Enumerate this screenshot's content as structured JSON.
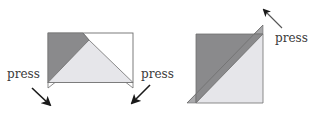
{
  "figures": [
    {
      "id": "left",
      "description": "Rectangle with dark top-left triangle, light center triangle, bottom flaps pressed down",
      "press_labels": [
        {
          "text": "press",
          "side": "left"
        },
        {
          "text": "press",
          "side": "right"
        }
      ]
    },
    {
      "id": "right",
      "description": "Square split diagonally into dark upper-left and light lower-right triangles with corner flaps",
      "press_labels": [
        {
          "text": "press",
          "side": "top-right"
        }
      ]
    }
  ],
  "colors": {
    "dark": "#8a8a8c",
    "light": "#e6e6ea",
    "outline": "#6e6e6e",
    "arrow": "#1a1a1a",
    "text": "#3a3a3a"
  }
}
